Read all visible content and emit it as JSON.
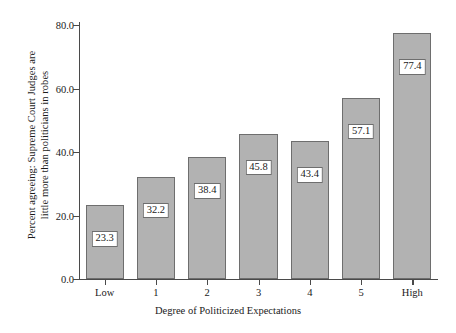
{
  "chart_data": {
    "type": "bar",
    "title": "",
    "subtitle": "",
    "categories": [
      "Low",
      "1",
      "2",
      "3",
      "4",
      "5",
      "High"
    ],
    "values": [
      23.3,
      32.2,
      38.4,
      45.8,
      43.4,
      57.1,
      77.4
    ],
    "data_labels": [
      "23.3",
      "32.2",
      "38.4",
      "45.8",
      "43.4",
      "57.1",
      "77.4"
    ],
    "xlabel": "Degree of Politicized Expectations",
    "ylabel_lines": [
      "Percent agreeing: Supreme Court Judges are",
      "little more than politicians in robes"
    ],
    "ylim": [
      0,
      80
    ],
    "yticks": [
      0,
      20,
      40,
      60,
      80
    ],
    "ytick_labels": [
      "0.0",
      "20.0",
      "40.0",
      "60.0",
      "80.0"
    ],
    "grid": false,
    "legend": null,
    "colors": {
      "bar_fill": "#b2b2b2",
      "bar_stroke": "#6e6e6e",
      "axis": "#4a4a4a",
      "text": "#1a1a1a",
      "label_box_fill": "#ffffff",
      "background": "#ffffff"
    }
  }
}
